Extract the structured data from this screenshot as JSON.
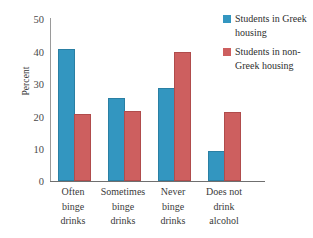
{
  "chart_data": {
    "type": "bar",
    "title": "",
    "xlabel": "",
    "ylabel": "Percent",
    "ylim": [
      0,
      50
    ],
    "yticks": [
      0,
      10,
      20,
      30,
      40,
      50
    ],
    "ytick_labels": [
      "0",
      "10",
      "20",
      "30",
      "40",
      "50"
    ],
    "grid": false,
    "legend_position": "top-right",
    "categories": [
      "Often binge drinks",
      "Sometimes binge drinks",
      "Never binge drinks",
      "Does not drink alcohol"
    ],
    "category_lines": [
      [
        "Often",
        "binge",
        "drinks"
      ],
      [
        "Sometimes",
        "binge",
        "drinks"
      ],
      [
        "Never",
        "binge",
        "drinks"
      ],
      [
        "Does not",
        "drink",
        "alcohol"
      ]
    ],
    "series": [
      {
        "name": "Students in Greek housing",
        "name_lines": [
          "Students in",
          "Greek housing"
        ],
        "color": "#3396c0",
        "values": [
          40,
          25,
          28,
          8.5
        ]
      },
      {
        "name": "Students in non-Greek housing",
        "name_lines": [
          "Students in",
          "non-Greek",
          "housing"
        ],
        "color": "#cd5f5f",
        "values": [
          20,
          21,
          39,
          20.5
        ]
      }
    ]
  },
  "colors": {
    "series_blue": "#3396c0",
    "series_red": "#cd5f5f",
    "axis": "#6f6f6f",
    "text": "#333333",
    "background": "#ffffff"
  },
  "axis": {
    "y_title": "Percent",
    "tick_0": "0",
    "tick_10": "10",
    "tick_20": "20",
    "tick_30": "30",
    "tick_40": "40",
    "tick_50": "50"
  },
  "legend": {
    "item_1_line_1": "Students in",
    "item_1_line_2": "Greek housing",
    "item_2_line_1": "Students in",
    "item_2_line_2": "non-Greek",
    "item_2_line_3": "housing"
  },
  "categories_text": {
    "c1_l1": "Often",
    "c1_l2": "binge",
    "c1_l3": "drinks",
    "c2_l1": "Sometimes",
    "c2_l2": "binge",
    "c2_l3": "drinks",
    "c3_l1": "Never",
    "c3_l2": "binge",
    "c3_l3": "drinks",
    "c4_l1": "Does not",
    "c4_l2": "drink",
    "c4_l3": "alcohol"
  }
}
